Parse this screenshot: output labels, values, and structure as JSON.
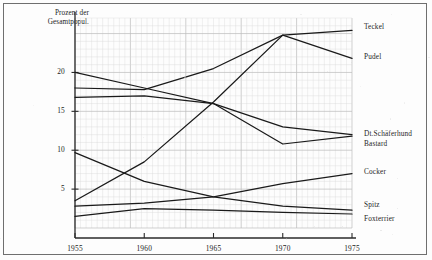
{
  "chart_data": {
    "type": "line",
    "title": "",
    "subtitle": "",
    "ylabel": "Prozent der Gesamtpopul.",
    "xlabel": "",
    "x": [
      1955,
      1960,
      1965,
      1970,
      1975
    ],
    "xticklabels": [
      "1955",
      "1960",
      "1965",
      "1970",
      "1975"
    ],
    "yticks": [
      5,
      10,
      15,
      20
    ],
    "yticklabels": [
      "5",
      "10",
      "15",
      "20"
    ],
    "xlim": [
      1955,
      1975
    ],
    "ylim": [
      0,
      27
    ],
    "grid": true,
    "grid_style": "graph-paper",
    "legend_position": "right-of-axes",
    "series": [
      {
        "name": "Teckel",
        "values": [
          18.0,
          17.8,
          20.5,
          24.8,
          25.4
        ]
      },
      {
        "name": "Pudel",
        "values": [
          3.5,
          8.5,
          16.2,
          24.8,
          21.8
        ]
      },
      {
        "name": "Dt.Schäferhund",
        "values": [
          20.0,
          18.0,
          16.0,
          13.0,
          12.0
        ]
      },
      {
        "name": "Bastard",
        "values": [
          16.8,
          17.0,
          16.0,
          10.8,
          11.8
        ]
      },
      {
        "name": "Cocker",
        "values": [
          2.8,
          3.2,
          4.0,
          5.7,
          7.0
        ]
      },
      {
        "name": "Spitz",
        "values": [
          9.7,
          6.0,
          4.0,
          2.8,
          2.3
        ]
      },
      {
        "name": "Foxterrier",
        "values": [
          1.5,
          2.5,
          2.3,
          2.0,
          1.8
        ]
      }
    ]
  },
  "axes": {
    "ylabel_line1": "Prozent der",
    "ylabel_line2": "Gesamtpopul."
  },
  "labels": {
    "teckel": "Teckel",
    "pudel": "Pudel",
    "schaeferhund": "Dt.Schäferhund",
    "bastard": "Bastard",
    "cocker": "Cocker",
    "spitz": "Spitz",
    "foxterrier": "Foxterrier"
  },
  "colors": {
    "line": "#1a1a1a",
    "grid_minor": "#d9d9d9",
    "grid_major": "#bcbcbc",
    "axis": "#2a2a2a",
    "paper": "#fdfdfd",
    "frame": "#6f6f6f"
  }
}
